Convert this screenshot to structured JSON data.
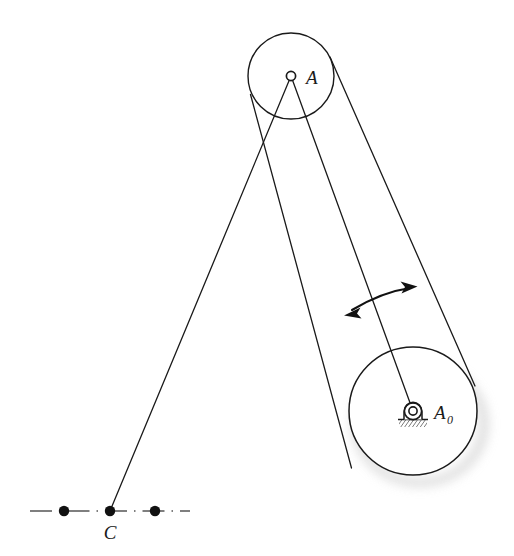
{
  "figure": {
    "kind": "kinematic-mechanism-diagram",
    "background_color": "#ffffff",
    "stroke_color": "#1a1a1a",
    "shadow_color": "#cfcfcf",
    "width": 514,
    "height": 556
  },
  "labels": {
    "point_a": "A",
    "point_a0_base": "A",
    "point_a0_subscript": "0",
    "point_c": "C"
  },
  "geometry": {
    "upper_pulley": {
      "cx": 291,
      "cy": 76,
      "r": 43
    },
    "lower_pulley": {
      "cx": 413,
      "cy": 411,
      "r": 64
    },
    "pivot_a0": {
      "cx": 413,
      "cy": 411,
      "outer_r": 9,
      "inner_r": 4
    },
    "joint_a": {
      "cx": 291,
      "cy": 76,
      "r": 4.5
    },
    "point_c": {
      "cx": 110,
      "cy": 511
    },
    "centerline": {
      "y": 511,
      "x_start": 30,
      "x_end": 190
    },
    "centerline_dots": [
      {
        "cx": 64,
        "cy": 511,
        "r": 5
      },
      {
        "cx": 110,
        "cy": 511,
        "r": 5
      },
      {
        "cx": 155,
        "cy": 511,
        "r": 5
      }
    ],
    "link_a_to_a0": {
      "x1": 291,
      "y1": 76,
      "x2": 413,
      "y2": 411
    },
    "link_a_to_c": {
      "x1": 291,
      "y1": 76,
      "x2": 110,
      "y2": 511
    },
    "belt_left_tangent": {
      "x1": 252,
      "y1": 95,
      "x2": 352,
      "y2": 467
    },
    "belt_right_tangent": {
      "x1": 329,
      "y1": 58,
      "x2": 474,
      "y2": 385
    },
    "rotation_arrow": {
      "start_x": 346,
      "start_y": 313,
      "ctrl_x": 380,
      "ctrl_y": 291,
      "end_x": 414,
      "end_y": 287,
      "double_headed": true
    }
  },
  "label_positions": {
    "a": {
      "x": 305,
      "y": 83
    },
    "a0": {
      "x": 435,
      "y": 418
    },
    "a0_sub": {
      "x": 450,
      "y": 423
    },
    "c": {
      "x": 103,
      "y": 538
    }
  }
}
